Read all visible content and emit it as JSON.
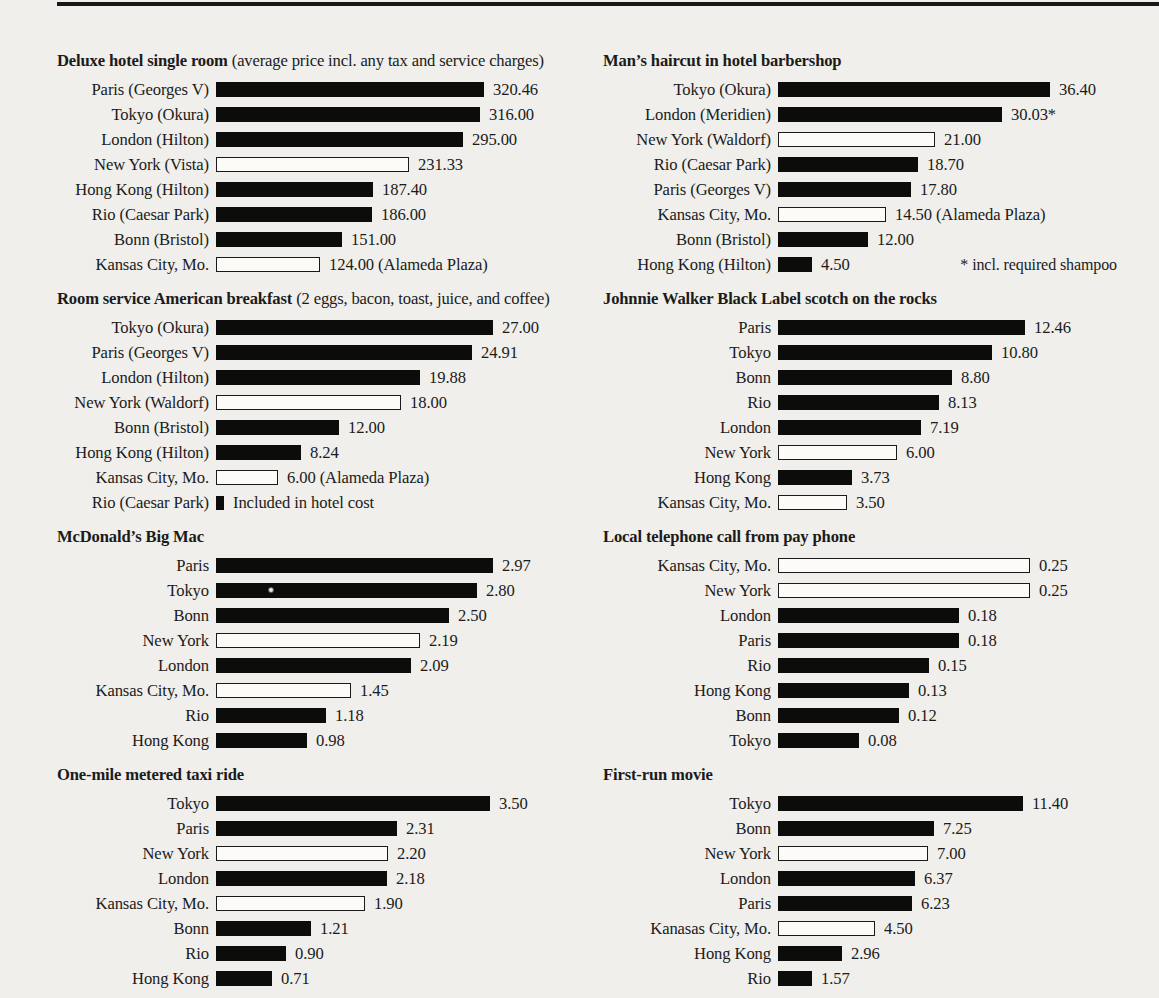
{
  "page": {
    "background": "#f0efeb",
    "top_rule_color": "#171717",
    "bar_fill_color": "#0c0c0a",
    "open_bar_color": "#fcfbf8"
  },
  "chart_data": [
    {
      "type": "bar",
      "orientation": "horizontal",
      "title": "Deluxe hotel single room",
      "subtitle": " (average price incl. any tax and service charges)",
      "rows": [
        {
          "label": "Paris (Georges V)",
          "value": 320.46,
          "display": "320.46",
          "bar": "filled"
        },
        {
          "label": "Tokyo (Okura)",
          "value": 316.0,
          "display": "316.00",
          "bar": "filled"
        },
        {
          "label": "London (Hilton)",
          "value": 295.0,
          "display": "295.00",
          "bar": "filled"
        },
        {
          "label": "New York (Vista)",
          "value": 231.33,
          "display": "231.33",
          "bar": "open"
        },
        {
          "label": "Hong Kong (Hilton)",
          "value": 187.4,
          "display": "187.40",
          "bar": "filled"
        },
        {
          "label": "Rio (Caesar Park)",
          "value": 186.0,
          "display": "186.00",
          "bar": "filled"
        },
        {
          "label": "Bonn (Bristol)",
          "value": 151.0,
          "display": "151.00",
          "bar": "filled"
        },
        {
          "label": "Kansas City, Mo.",
          "value": 124.0,
          "display": "124.00 (Alameda Plaza)",
          "bar": "open"
        }
      ]
    },
    {
      "type": "bar",
      "orientation": "horizontal",
      "title": "Man’s haircut in hotel barbershop",
      "subtitle": "",
      "footnote": "* incl. required shampoo",
      "rows": [
        {
          "label": "Tokyo (Okura)",
          "value": 36.4,
          "display": "36.40",
          "bar": "filled"
        },
        {
          "label": "London (Meridien)",
          "value": 30.03,
          "display": "30.03*",
          "bar": "filled"
        },
        {
          "label": "New York (Waldorf)",
          "value": 21.0,
          "display": "21.00",
          "bar": "open"
        },
        {
          "label": "Rio (Caesar Park)",
          "value": 18.7,
          "display": "18.70",
          "bar": "filled"
        },
        {
          "label": "Paris (Georges V)",
          "value": 17.8,
          "display": "17.80",
          "bar": "filled"
        },
        {
          "label": "Kansas City, Mo.",
          "value": 14.5,
          "display": "14.50 (Alameda Plaza)",
          "bar": "open"
        },
        {
          "label": "Bonn (Bristol)",
          "value": 12.0,
          "display": "12.00",
          "bar": "filled"
        },
        {
          "label": "Hong Kong (Hilton)",
          "value": 4.5,
          "display": "4.50",
          "bar": "filled"
        }
      ]
    },
    {
      "type": "bar",
      "orientation": "horizontal",
      "title": "Room service American breakfast",
      "subtitle": " (2 eggs, bacon, toast, juice, and coffee)",
      "rows": [
        {
          "label": "Tokyo (Okura)",
          "value": 27.0,
          "display": "27.00",
          "bar": "filled"
        },
        {
          "label": "Paris (Georges V)",
          "value": 24.91,
          "display": "24.91",
          "bar": "filled"
        },
        {
          "label": "London (Hilton)",
          "value": 19.88,
          "display": "19.88",
          "bar": "filled"
        },
        {
          "label": "New York (Waldorf)",
          "value": 18.0,
          "display": "18.00",
          "bar": "open"
        },
        {
          "label": "Bonn (Bristol)",
          "value": 12.0,
          "display": "12.00",
          "bar": "filled"
        },
        {
          "label": "Hong Kong (Hilton)",
          "value": 8.24,
          "display": "8.24",
          "bar": "filled"
        },
        {
          "label": "Kansas City, Mo.",
          "value": 6.0,
          "display": "6.00 (Alameda Plaza)",
          "bar": "open"
        },
        {
          "label": "Rio (Caesar Park)",
          "value": null,
          "display": "Included in hotel cost",
          "bar": "tick"
        }
      ]
    },
    {
      "type": "bar",
      "orientation": "horizontal",
      "title": "Johnnie Walker Black Label scotch on the rocks",
      "subtitle": "",
      "rows": [
        {
          "label": "Paris",
          "value": 12.46,
          "display": "12.46",
          "bar": "filled"
        },
        {
          "label": "Tokyo",
          "value": 10.8,
          "display": "10.80",
          "bar": "filled"
        },
        {
          "label": "Bonn",
          "value": 8.8,
          "display": "8.80",
          "bar": "filled"
        },
        {
          "label": "Rio",
          "value": 8.13,
          "display": "8.13",
          "bar": "filled"
        },
        {
          "label": "London",
          "value": 7.19,
          "display": "7.19",
          "bar": "filled"
        },
        {
          "label": "New York",
          "value": 6.0,
          "display": "6.00",
          "bar": "open"
        },
        {
          "label": "Hong Kong",
          "value": 3.73,
          "display": "3.73",
          "bar": "filled"
        },
        {
          "label": "Kansas City, Mo.",
          "value": 3.5,
          "display": "3.50",
          "bar": "open"
        }
      ]
    },
    {
      "type": "bar",
      "orientation": "horizontal",
      "title": "McDonald’s Big Mac",
      "subtitle": "",
      "rows": [
        {
          "label": "Paris",
          "value": 2.97,
          "display": "2.97",
          "bar": "filled"
        },
        {
          "label": "Tokyo",
          "value": 2.8,
          "display": "2.80",
          "bar": "filled",
          "artifact_dot": true
        },
        {
          "label": "Bonn",
          "value": 2.5,
          "display": "2.50",
          "bar": "filled"
        },
        {
          "label": "New York",
          "value": 2.19,
          "display": "2.19",
          "bar": "open"
        },
        {
          "label": "London",
          "value": 2.09,
          "display": "2.09",
          "bar": "filled"
        },
        {
          "label": "Kansas City, Mo.",
          "value": 1.45,
          "display": "1.45",
          "bar": "open"
        },
        {
          "label": "Rio",
          "value": 1.18,
          "display": "1.18",
          "bar": "filled"
        },
        {
          "label": "Hong Kong",
          "value": 0.98,
          "display": "0.98",
          "bar": "filled"
        }
      ]
    },
    {
      "type": "bar",
      "orientation": "horizontal",
      "title": "Local telephone call from pay phone",
      "subtitle": "",
      "rows": [
        {
          "label": "Kansas City, Mo.",
          "value": 0.25,
          "display": "0.25",
          "bar": "open"
        },
        {
          "label": "New York",
          "value": 0.25,
          "display": "0.25",
          "bar": "open"
        },
        {
          "label": "London",
          "value": 0.18,
          "display": "0.18",
          "bar": "filled"
        },
        {
          "label": "Paris",
          "value": 0.18,
          "display": "0.18",
          "bar": "filled"
        },
        {
          "label": "Rio",
          "value": 0.15,
          "display": "0.15",
          "bar": "filled"
        },
        {
          "label": "Hong Kong",
          "value": 0.13,
          "display": "0.13",
          "bar": "filled"
        },
        {
          "label": "Bonn",
          "value": 0.12,
          "display": "0.12",
          "bar": "filled"
        },
        {
          "label": "Tokyo",
          "value": 0.08,
          "display": "0.08",
          "bar": "filled"
        }
      ]
    },
    {
      "type": "bar",
      "orientation": "horizontal",
      "title": "One-mile metered taxi ride",
      "subtitle": "",
      "rows": [
        {
          "label": "Tokyo",
          "value": 3.5,
          "display": "3.50",
          "bar": "filled"
        },
        {
          "label": "Paris",
          "value": 2.31,
          "display": "2.31",
          "bar": "filled"
        },
        {
          "label": "New York",
          "value": 2.2,
          "display": "2.20",
          "bar": "open"
        },
        {
          "label": "London",
          "value": 2.18,
          "display": "2.18",
          "bar": "filled"
        },
        {
          "label": "Kansas City, Mo.",
          "value": 1.9,
          "display": "1.90",
          "bar": "open"
        },
        {
          "label": "Bonn",
          "value": 1.21,
          "display": "1.21",
          "bar": "filled"
        },
        {
          "label": "Rio",
          "value": 0.9,
          "display": "0.90",
          "bar": "filled"
        },
        {
          "label": "Hong Kong",
          "value": 0.71,
          "display": "0.71",
          "bar": "filled"
        }
      ]
    },
    {
      "type": "bar",
      "orientation": "horizontal",
      "title": "First-run movie",
      "subtitle": "",
      "rows": [
        {
          "label": "Tokyo",
          "value": 11.4,
          "display": "11.40",
          "bar": "filled"
        },
        {
          "label": "Bonn",
          "value": 7.25,
          "display": "7.25",
          "bar": "filled"
        },
        {
          "label": "New York",
          "value": 7.0,
          "display": "7.00",
          "bar": "open"
        },
        {
          "label": "London",
          "value": 6.37,
          "display": "6.37",
          "bar": "filled"
        },
        {
          "label": "Paris",
          "value": 6.23,
          "display": "6.23",
          "bar": "filled"
        },
        {
          "label": "Kanasas City, Mo.",
          "value": 4.5,
          "display": "4.50",
          "bar": "open"
        },
        {
          "label": "Hong Kong",
          "value": 2.96,
          "display": "2.96",
          "bar": "filled"
        },
        {
          "label": "Rio",
          "value": 1.57,
          "display": "1.57",
          "bar": "filled"
        }
      ]
    }
  ]
}
